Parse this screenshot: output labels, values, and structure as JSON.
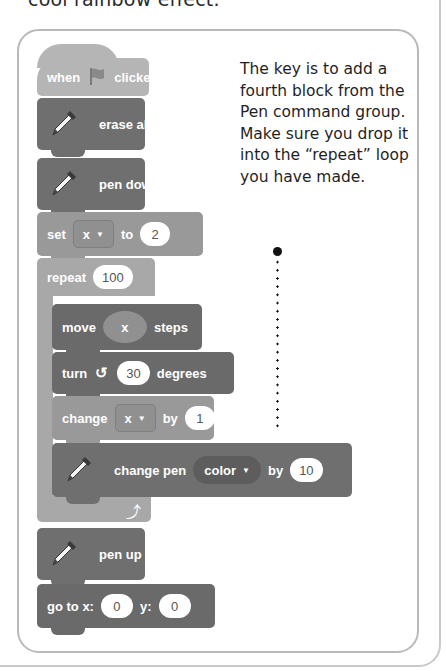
{
  "caption": {
    "text": "cool rainbow effect."
  },
  "script": {
    "when_flag": {
      "when": "when",
      "clicked": "clicked",
      "icon": "green-flag-icon"
    },
    "erase_all": {
      "label": "erase all",
      "icon": "pen-icon"
    },
    "pen_down": {
      "label": "pen down",
      "icon": "pen-icon"
    },
    "set_var": {
      "label": "set",
      "variable": "x",
      "to": "to",
      "value": "2"
    },
    "repeat": {
      "label": "repeat",
      "count": "100",
      "loop_icon": "loop-arrow-icon"
    },
    "move": {
      "label": "move",
      "reporter": "x",
      "steps": "steps"
    },
    "turn": {
      "label": "turn",
      "direction_icon": "rotate-left-icon",
      "value": "30",
      "unit": "degrees"
    },
    "change_var": {
      "label": "change",
      "variable": "x",
      "by": "by",
      "value": "1"
    },
    "change_pen": {
      "label": "change pen",
      "param": "color",
      "by": "by",
      "value": "10",
      "icon": "pen-icon"
    },
    "pen_up": {
      "label": "pen up",
      "icon": "pen-icon"
    },
    "go_to": {
      "label": "go to x:",
      "x": "0",
      "y_label": "y:",
      "y": "0"
    }
  },
  "note": {
    "text": "The key is to add a fourth block from the Pen command group. Make sure you drop it into the “repeat” loop you have made."
  },
  "colors": {
    "hat": "#b5b5b5",
    "pen": "#6f6f6f",
    "data": "#999999",
    "control": "#a8a8a8",
    "motion": "#6a6a6a",
    "frame_border": "#b9b9b9"
  }
}
